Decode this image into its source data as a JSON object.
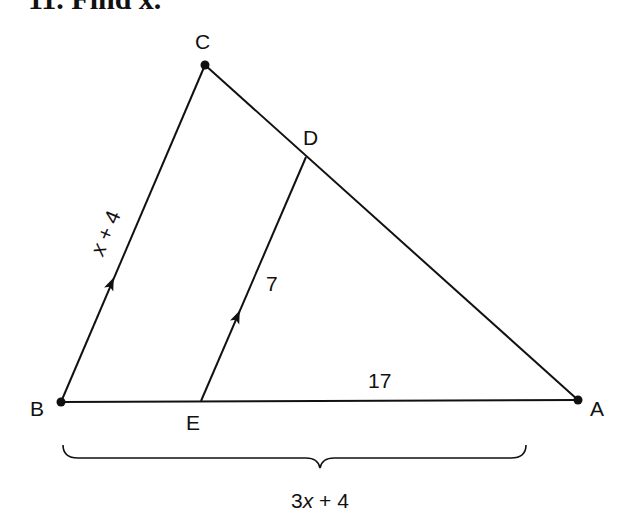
{
  "problem": {
    "title": "11. Find x."
  },
  "diagram": {
    "points": {
      "A": {
        "label": "A",
        "x": 578,
        "y": 400
      },
      "B": {
        "label": "B",
        "x": 61,
        "y": 402
      },
      "C": {
        "label": "C",
        "x": 205,
        "y": 65
      },
      "D": {
        "label": "D",
        "x": 306,
        "y": 157
      },
      "E": {
        "label": "E",
        "x": 201,
        "y": 401
      }
    },
    "segments": [
      {
        "from": "B",
        "to": "C",
        "label_var": "x",
        "label_rest": " + 4",
        "parallel_arrow": true
      },
      {
        "from": "E",
        "to": "D",
        "label": "7",
        "parallel_arrow": true
      },
      {
        "from": "C",
        "to": "A"
      },
      {
        "from": "B",
        "to": "A"
      }
    ],
    "labels": {
      "bc_var": "x",
      "bc_rest": " + 4",
      "ed": "7",
      "ea": "17",
      "brace_coef": "3",
      "brace_var": "x",
      "brace_rest": " + 4"
    },
    "brace": {
      "from": "B",
      "to": "A",
      "label": "3x + 4"
    }
  }
}
